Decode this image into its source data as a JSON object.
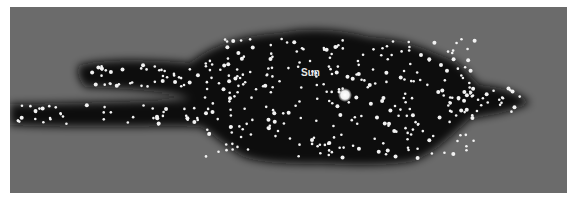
{
  "diagram": {
    "label": "Sun",
    "colors": {
      "background": "#6b6b6b",
      "cloud": "#0c0c0c",
      "star": "#f2f2f2",
      "label": "#e6e6e6"
    },
    "sun": {
      "x": 335,
      "y": 88,
      "r": 5
    },
    "label_pos": {
      "x": 324,
      "y": 67
    }
  }
}
